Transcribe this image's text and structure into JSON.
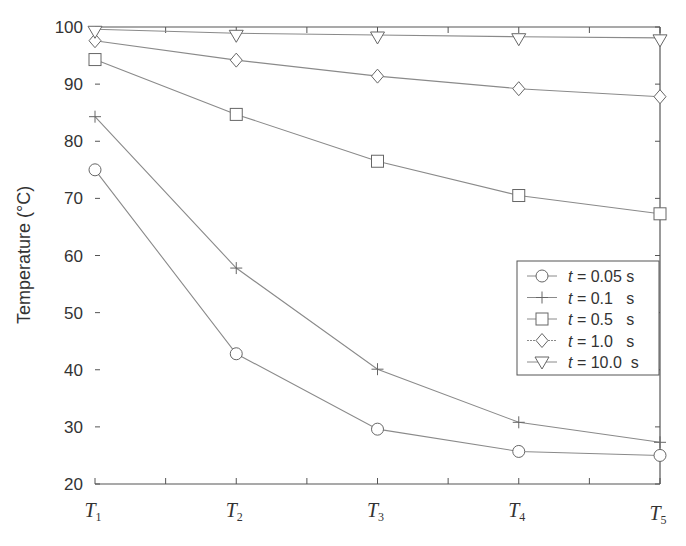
{
  "chart_data": {
    "type": "line",
    "title": "",
    "xlabel": "",
    "ylabel": "Temperature (°C)",
    "categories": [
      "T1",
      "T2",
      "T3",
      "T4",
      "T5"
    ],
    "category_labels": [
      {
        "main": "T",
        "sub": "1"
      },
      {
        "main": "T",
        "sub": "2"
      },
      {
        "main": "T",
        "sub": "3"
      },
      {
        "main": "T",
        "sub": "4"
      },
      {
        "main": "T",
        "sub": "5"
      }
    ],
    "ylim": [
      20,
      100
    ],
    "yticks": [
      20,
      30,
      40,
      50,
      60,
      70,
      80,
      90,
      100
    ],
    "grid": false,
    "legend_position": "right-center (inside)",
    "series": [
      {
        "name": "t = 0.05 s",
        "var": "t",
        "label": " = 0.05 s",
        "marker": "circle",
        "values": [
          75.0,
          42.8,
          29.6,
          25.7,
          25.0
        ]
      },
      {
        "name": "t = 0.1 s",
        "var": "t",
        "label": " = 0.1   s",
        "marker": "plus",
        "values": [
          84.3,
          57.8,
          40.1,
          30.8,
          27.3
        ]
      },
      {
        "name": "t = 0.5 s",
        "var": "t",
        "label": " = 0.5   s",
        "marker": "square",
        "values": [
          94.3,
          84.7,
          76.5,
          70.5,
          67.3
        ]
      },
      {
        "name": "t = 1.0 s",
        "var": "t",
        "label": " = 1.0   s",
        "marker": "diamond",
        "values": [
          97.6,
          94.2,
          91.4,
          89.2,
          87.8
        ]
      },
      {
        "name": "t = 10.0 s",
        "var": "t",
        "label": " = 10.0  s",
        "marker": "triangle-down",
        "values": [
          99.6,
          98.9,
          98.6,
          98.3,
          98.1
        ]
      }
    ]
  },
  "colors": {
    "line": "#8a8a8a",
    "marker": "#666666",
    "axis": "#555555",
    "text": "#333333"
  }
}
